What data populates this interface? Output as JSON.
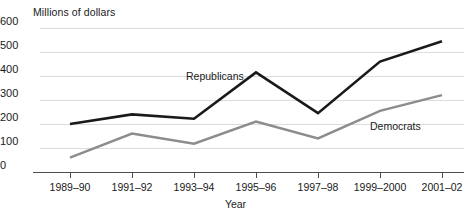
{
  "chart_data": {
    "type": "line",
    "title": "",
    "ylabel": "Millions of dollars",
    "xlabel": "Year",
    "categories": [
      "1989–90",
      "1991–92",
      "1993–94",
      "1995–96",
      "1997–98",
      "1999–2000",
      "2001–02"
    ],
    "ylim": [
      0,
      600
    ],
    "yticks": [
      0,
      100,
      200,
      300,
      400,
      500,
      600
    ],
    "ytick_labels": [
      "0",
      "100",
      "200",
      "300",
      "400",
      "500",
      "600"
    ],
    "grid": true,
    "legend_position": "inline",
    "series": [
      {
        "name": "Republicans",
        "color": "#1a1a1a",
        "values": [
          200,
          240,
          222,
          415,
          245,
          460,
          545
        ]
      },
      {
        "name": "Democrats",
        "color": "#8c8c8c",
        "values": [
          60,
          160,
          118,
          210,
          140,
          255,
          320
        ]
      }
    ],
    "annotations": [
      {
        "text": "Republicans",
        "series": "Republicans"
      },
      {
        "text": "Democrats",
        "series": "Democrats"
      }
    ]
  }
}
